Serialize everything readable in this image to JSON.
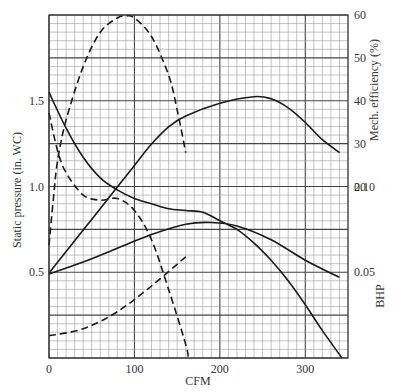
{
  "chart_data": {
    "type": "line",
    "title": "",
    "xlabel": "CFM",
    "ylabel_left": "Static pressure (in. WC)",
    "ylabel_right_upper": "Mech. efficiency (%)",
    "ylabel_right_lower": "BHP",
    "xlim": [
      0,
      350
    ],
    "ylim_left": [
      0,
      2.0
    ],
    "ylim_efficiency": [
      0,
      60
    ],
    "ylim_bhp": [
      0,
      0.2
    ],
    "grid": true,
    "legend": "none",
    "x_ticks": [
      {
        "value": 0,
        "label": "0"
      },
      {
        "value": 100,
        "label": "100"
      },
      {
        "value": 200,
        "label": "200"
      },
      {
        "value": 300,
        "label": "300"
      }
    ],
    "left_ticks": [
      {
        "value": 1.5,
        "label": "1.5"
      },
      {
        "value": 1.0,
        "label": "1.0"
      },
      {
        "value": 0.5,
        "label": "0.5"
      }
    ],
    "efficiency_ticks": [
      {
        "value": 60,
        "label": "60"
      },
      {
        "value": 50,
        "label": "50"
      },
      {
        "value": 40,
        "label": "40"
      },
      {
        "value": 30,
        "label": "30"
      },
      {
        "value": 20,
        "label": "20"
      }
    ],
    "bhp_ticks": [
      {
        "value": 0.1,
        "label": "0.10"
      },
      {
        "value": 0.05,
        "label": "0.05"
      }
    ],
    "series": [
      {
        "name": "Static pressure (solid)",
        "axis": "pressure",
        "style": "solid",
        "x": [
          0,
          20,
          40,
          60,
          80,
          100,
          120,
          140,
          160,
          180,
          200,
          220,
          240,
          260,
          280,
          300,
          320,
          343
        ],
        "values": [
          1.55,
          1.34,
          1.17,
          1.05,
          0.98,
          0.93,
          0.9,
          0.87,
          0.86,
          0.85,
          0.8,
          0.75,
          0.67,
          0.57,
          0.45,
          0.31,
          0.16,
          0.0
        ]
      },
      {
        "name": "Mech. efficiency (solid)",
        "axis": "efficiency",
        "style": "solid",
        "x": [
          0,
          40,
          80,
          100,
          120,
          140,
          160,
          200,
          240,
          260,
          280,
          300,
          320,
          340
        ],
        "values": [
          0,
          10,
          20,
          25,
          30,
          34,
          36.5,
          39.5,
          41,
          40.5,
          38.4,
          35,
          31,
          28
        ]
      },
      {
        "name": "BHP (solid)",
        "axis": "bhp",
        "style": "solid",
        "x": [
          0,
          40,
          80,
          120,
          160,
          190,
          220,
          260,
          300,
          340
        ],
        "values": [
          0.049,
          0.056,
          0.064,
          0.072,
          0.078,
          0.079,
          0.077,
          0.069,
          0.057,
          0.047
        ]
      },
      {
        "name": "Mech. efficiency (dashed)",
        "axis": "efficiency",
        "style": "dashed",
        "x": [
          0,
          5,
          10,
          20,
          40,
          60,
          80,
          90,
          100,
          120,
          140,
          150,
          160
        ],
        "values": [
          6.5,
          17,
          26,
          35.6,
          48,
          56,
          59.3,
          59.8,
          59.3,
          55,
          46,
          38,
          28
        ]
      },
      {
        "name": "Static pressure (dashed)",
        "axis": "pressure",
        "style": "dashed",
        "x": [
          0,
          10,
          20,
          40,
          60,
          80,
          100,
          120,
          140,
          160,
          163
        ],
        "values": [
          1.43,
          1.21,
          1.08,
          0.95,
          0.92,
          0.93,
          0.86,
          0.69,
          0.4,
          0.08,
          0.0
        ]
      },
      {
        "name": "BHP (dashed)",
        "axis": "bhp",
        "style": "dashed",
        "x": [
          0,
          40,
          80,
          120,
          160
        ],
        "values": [
          0.013,
          0.017,
          0.027,
          0.042,
          0.059
        ]
      }
    ]
  },
  "colors": {
    "grid_minor": "#9a9a9a",
    "grid_major": "#444444",
    "curve": "#1a1a1a",
    "text": "#333333"
  }
}
